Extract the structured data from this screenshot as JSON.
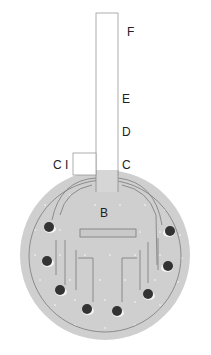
{
  "labels": {
    "F": "F",
    "E": "E",
    "D": "D",
    "C": "C",
    "C1": "C I",
    "B": "B"
  },
  "colors": {
    "disc_fill": "#cfcfcf",
    "outline": "#707070",
    "pin": "#333333",
    "tube_fill": "#ffffff"
  },
  "pins": [
    {
      "x": 49,
      "y": 227
    },
    {
      "x": 47,
      "y": 261
    },
    {
      "x": 60,
      "y": 290
    },
    {
      "x": 87,
      "y": 309
    },
    {
      "x": 117,
      "y": 311
    },
    {
      "x": 148,
      "y": 294
    },
    {
      "x": 168,
      "y": 266
    },
    {
      "x": 170,
      "y": 231
    }
  ]
}
